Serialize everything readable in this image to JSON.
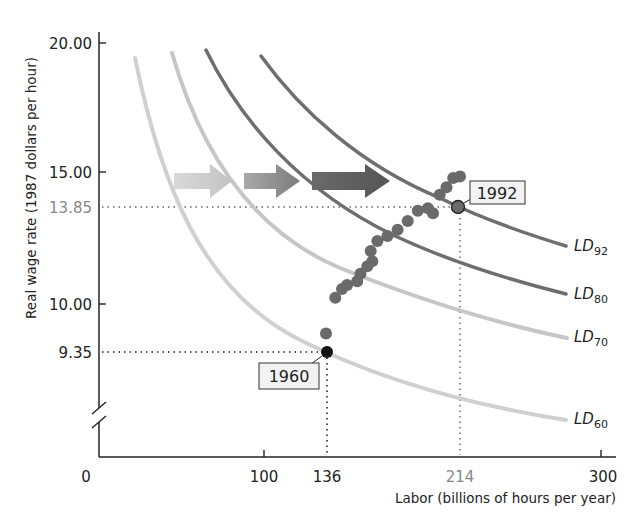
{
  "chart_data": {
    "type": "line",
    "title": "",
    "xlabel": "Labor (billions of hours per year)",
    "ylabel": "Real wage rate (1987 dollars per hour)",
    "xlim": [
      0,
      300
    ],
    "ylim": [
      8,
      20
    ],
    "y_axis_break": true,
    "grid": false,
    "x_ticks": [
      {
        "value": 0,
        "label": "0"
      },
      {
        "value": 100,
        "label": "100"
      },
      {
        "value": 136,
        "label": "136"
      },
      {
        "value": 214,
        "label": "214",
        "highlight": true
      },
      {
        "value": 300,
        "label": "300"
      }
    ],
    "y_ticks": [
      {
        "value": 20,
        "label": "20.00"
      },
      {
        "value": 15,
        "label": "15.00"
      },
      {
        "value": 13.85,
        "label": "13.85",
        "highlight": true
      },
      {
        "value": 10,
        "label": "10.00"
      },
      {
        "value": 9.35,
        "label": "9.35"
      }
    ],
    "series": [
      {
        "name": "LD60",
        "label_main": "LD",
        "label_sub": "60",
        "color": "#cfcfcf",
        "points": [
          [
            23,
            19.3
          ],
          [
            50,
            15.0
          ],
          [
            72,
            12.5
          ],
          [
            100,
            10.9
          ],
          [
            136,
            9.35
          ],
          [
            175,
            8.8
          ],
          [
            214,
            8.4
          ],
          [
            278,
            8.0
          ]
        ]
      },
      {
        "name": "LD70",
        "label_main": "LD",
        "label_sub": "70",
        "color": "#c2c2c2",
        "points": [
          [
            45,
            19.6
          ],
          [
            70,
            16.6
          ],
          [
            87,
            14.9
          ],
          [
            110,
            13.5
          ],
          [
            140,
            12.4
          ],
          [
            175,
            11.2
          ],
          [
            214,
            10.3
          ],
          [
            279,
            9.35
          ]
        ]
      },
      {
        "name": "LD80",
        "label_main": "LD",
        "label_sub": "80",
        "color": "#6e6e6e",
        "points": [
          [
            65,
            19.7
          ],
          [
            90,
            17.3
          ],
          [
            120,
            15.2
          ],
          [
            160,
            13.5
          ],
          [
            185,
            12.6
          ],
          [
            214,
            11.8
          ],
          [
            278,
            10.2
          ]
        ]
      },
      {
        "name": "LD92",
        "label_main": "LD",
        "label_sub": "92",
        "color": "#6e6e6e",
        "points": [
          [
            97,
            19.5
          ],
          [
            125,
            17.4
          ],
          [
            160,
            15.8
          ],
          [
            204,
            14.3
          ],
          [
            214,
            13.85
          ],
          [
            240,
            13.0
          ],
          [
            278,
            12.1
          ]
        ]
      }
    ],
    "scatter": {
      "name": "Actual (1960–1992)",
      "color": "#6a6a6a",
      "points": [
        [
          136,
          9.35
        ],
        [
          136.5,
          9.6
        ],
        [
          142,
          10.25
        ],
        [
          146,
          10.6
        ],
        [
          149,
          10.75
        ],
        [
          155,
          10.9
        ],
        [
          157,
          11.2
        ],
        [
          161,
          11.5
        ],
        [
          164,
          11.7
        ],
        [
          163,
          12.1
        ],
        [
          167,
          12.5
        ],
        [
          173,
          12.7
        ],
        [
          179,
          12.95
        ],
        [
          185,
          13.3
        ],
        [
          191,
          13.7
        ],
        [
          197,
          13.8
        ],
        [
          200,
          13.6
        ],
        [
          204,
          14.25
        ],
        [
          208,
          14.5
        ],
        [
          212,
          14.8
        ],
        [
          216,
          14.85
        ]
      ],
      "start": {
        "year": "1960",
        "labor": 136,
        "wage": 9.35
      },
      "end": {
        "year": "1992",
        "labor": 214,
        "wage": 13.85
      }
    },
    "annotations": [
      {
        "type": "shift-arrow",
        "shade": "light"
      },
      {
        "type": "shift-arrow",
        "shade": "medium"
      },
      {
        "type": "shift-arrow",
        "shade": "dark"
      }
    ]
  },
  "labels": {
    "y_axis_title": "Real wage rate (1987 dollars per hour)",
    "x_axis_title": "Labor (billions of hours per year)",
    "year_start": "1960",
    "year_end": "1992",
    "ld60_main": "LD",
    "ld60_sub": "60",
    "ld70_main": "LD",
    "ld70_sub": "70",
    "ld80_main": "LD",
    "ld80_sub": "80",
    "ld92_main": "LD",
    "ld92_sub": "92",
    "x0": "0",
    "x100": "100",
    "x136": "136",
    "x214": "214",
    "x300": "300",
    "y20": "20.00",
    "y15": "15.00",
    "y1385": "13.85",
    "y10": "10.00",
    "y935": "9.35"
  }
}
